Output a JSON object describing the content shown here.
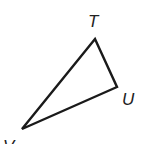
{
  "diagram": {
    "type": "triangle",
    "stroke_color": "#1a1a1a",
    "vertices": [
      {
        "name": "T",
        "x": 95,
        "y": 39,
        "label_x": 88,
        "label_y": 27
      },
      {
        "name": "U",
        "x": 117,
        "y": 87,
        "label_x": 122,
        "label_y": 105
      },
      {
        "name": "V",
        "x": 22,
        "y": 129,
        "label_x": 3,
        "label_y": 152
      }
    ],
    "labels": {
      "t": "T",
      "u": "U",
      "v": "V"
    }
  }
}
